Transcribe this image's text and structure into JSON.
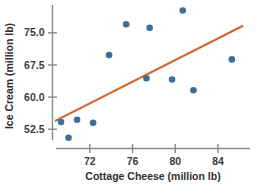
{
  "chart_data": {
    "type": "scatter",
    "title": "",
    "xlabel": "Cottage Cheese (million lb)",
    "ylabel": "Ice Cream (million lb)",
    "xlim": [
      68.5,
      87.0
    ],
    "ylim": [
      48.0,
      81.5
    ],
    "xticks": [
      72,
      76,
      80,
      84
    ],
    "xtick_labels": [
      "72",
      "76",
      "80",
      "84"
    ],
    "yticks": [
      52.5,
      60.0,
      67.5,
      75.0
    ],
    "ytick_labels": [
      "52.5",
      "60.0",
      "67.5",
      "75.0"
    ],
    "grid": false,
    "legend": "none",
    "marker_color": "#3e6e93",
    "trendline_color": "#d9622b",
    "axis_color": "#8a8a8a",
    "points": [
      {
        "x": 69.3,
        "y": 54.2
      },
      {
        "x": 70.0,
        "y": 50.5
      },
      {
        "x": 70.8,
        "y": 54.7
      },
      {
        "x": 72.3,
        "y": 54.0
      },
      {
        "x": 73.8,
        "y": 69.8
      },
      {
        "x": 75.4,
        "y": 77.0
      },
      {
        "x": 77.3,
        "y": 64.4
      },
      {
        "x": 77.6,
        "y": 76.2
      },
      {
        "x": 79.7,
        "y": 64.1
      },
      {
        "x": 80.7,
        "y": 80.2
      },
      {
        "x": 81.7,
        "y": 61.6
      },
      {
        "x": 85.3,
        "y": 68.8
      }
    ],
    "trendline": {
      "x_start": 68.8,
      "y_start": 54.5,
      "x_end": 86.3,
      "y_end": 76.6
    }
  }
}
